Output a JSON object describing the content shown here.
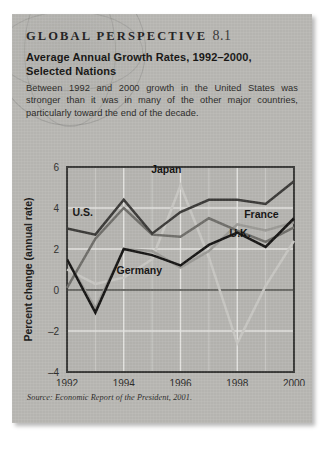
{
  "panel": {
    "kicker": "GLOBAL PERSPECTIVE",
    "number": "8.1",
    "title": "Average Annual Growth Rates, 1992–2000, Selected Nations",
    "body": "Between 1992 and 2000 growth in the United States was stronger than it was in many of the other major countries, particularly toward the end of the decade.",
    "source": "Source: Economic Report of the President, 2001.",
    "background_color": "#b9b8b4",
    "text_color": "#151413"
  },
  "chart_data": {
    "type": "line",
    "title": "Average Annual Growth Rates, 1992–2000, Selected Nations",
    "xlabel": "Year",
    "ylabel": "Percent change (annual rate)",
    "x": [
      1992,
      1993,
      1994,
      1995,
      1996,
      1997,
      1998,
      1999,
      2000
    ],
    "xtick_labels": [
      "1992",
      "1994",
      "1996",
      "1998",
      "2000"
    ],
    "xticks": [
      1992,
      1994,
      1996,
      1998,
      2000
    ],
    "ytick_labels": [
      "6",
      "4",
      "2",
      "0",
      "-2",
      "-4"
    ],
    "yticks": [
      6,
      4,
      2,
      0,
      -2,
      -4
    ],
    "xlim": [
      1992,
      2000
    ],
    "ylim": [
      -4,
      6
    ],
    "grid": true,
    "zero_line": true,
    "legend": "inline-labels",
    "series": [
      {
        "name": "U.S.",
        "color": "#3b3a38",
        "label_x": 1992.55,
        "label_y": 3.62,
        "values": [
          3.0,
          2.7,
          4.4,
          2.75,
          3.8,
          4.4,
          4.4,
          4.2,
          5.3
        ]
      },
      {
        "name": "Japan",
        "color": "#c8c7c3",
        "label_x": 1995.5,
        "label_y": 5.72,
        "values": [
          1.0,
          0.3,
          0.6,
          1.5,
          5.1,
          1.6,
          -2.6,
          0.2,
          2.4
        ]
      },
      {
        "name": "France",
        "color": "#9b9a96",
        "label_x": 1998.85,
        "label_y": 3.5,
        "values": [
          1.5,
          -0.9,
          2.0,
          1.9,
          1.1,
          1.9,
          3.2,
          2.9,
          3.3
        ]
      },
      {
        "name": "U.K.",
        "color": "#6f6e6a",
        "label_x": 1998.1,
        "label_y": 2.6,
        "values": [
          0.1,
          2.5,
          4.0,
          2.7,
          2.6,
          3.5,
          2.9,
          2.35,
          3.05
        ]
      },
      {
        "name": "Germany",
        "color": "#171615",
        "label_x": 1994.55,
        "label_y": 0.78,
        "values": [
          1.5,
          -1.1,
          2.0,
          1.7,
          1.2,
          2.2,
          2.8,
          2.1,
          3.5
        ]
      }
    ]
  },
  "plot": {
    "frame_color": "#3a3a38",
    "grid_color": "#e9e9e6",
    "zero_line_color": "#6a6a66",
    "plot_bg": "#b6b5b1"
  }
}
